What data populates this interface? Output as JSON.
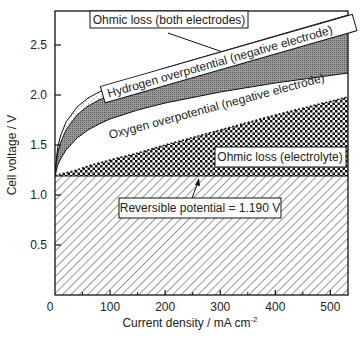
{
  "chart_data": {
    "type": "area",
    "title": "",
    "xlabel": "Current density / mA cm⁻²",
    "xlabel_main": "Current density / mA cm",
    "xlabel_sup": "-2",
    "ylabel": "Cell voltage / V",
    "xlim": [
      0,
      532
    ],
    "ylim": [
      0,
      2.85
    ],
    "xticks": [
      0,
      100,
      200,
      300,
      400,
      500
    ],
    "xtick_labels": [
      "0",
      "100",
      "200",
      "300",
      "400",
      "500"
    ],
    "yticks": [
      0.5,
      1.0,
      1.5,
      2.0,
      2.5
    ],
    "ytick_labels": [
      "0.5",
      "1.0",
      "1.5",
      "2.0",
      "2.5"
    ],
    "grid": false,
    "legend": "none (inline boxed annotations)",
    "x": [
      0,
      5,
      10,
      20,
      40,
      60,
      80,
      100,
      150,
      200,
      300,
      400,
      532
    ],
    "series": [
      {
        "name": "Reversible potential = 1.190 V",
        "pattern": "diagonal-hatch",
        "values": [
          1.19,
          1.19,
          1.19,
          1.19,
          1.19,
          1.19,
          1.19,
          1.19,
          1.19,
          1.19,
          1.19,
          1.19,
          1.19
        ]
      },
      {
        "name": "Ohmic loss (electrolyte)",
        "pattern": "checkerboard",
        "values": [
          1.19,
          1.2,
          1.21,
          1.22,
          1.25,
          1.29,
          1.32,
          1.35,
          1.42,
          1.5,
          1.65,
          1.8,
          1.98
        ]
      },
      {
        "name": "Oxygen overpotential (negative electrode)",
        "pattern": "white",
        "values": [
          1.19,
          1.3,
          1.36,
          1.45,
          1.57,
          1.65,
          1.71,
          1.76,
          1.85,
          1.92,
          2.03,
          2.12,
          2.22
        ]
      },
      {
        "name": "Hydrogen overpotential (negative electrode)",
        "pattern": "gray-stipple",
        "values": [
          1.22,
          1.42,
          1.52,
          1.65,
          1.8,
          1.89,
          1.95,
          2.0,
          2.09,
          2.17,
          2.32,
          2.47,
          2.66
        ]
      },
      {
        "name": "Ohmic loss (both electrodes)",
        "pattern": "light-dots",
        "values": [
          1.25,
          1.48,
          1.59,
          1.73,
          1.88,
          1.97,
          2.03,
          2.08,
          2.18,
          2.27,
          2.43,
          2.59,
          2.8
        ]
      }
    ],
    "annotations": [
      "Ohmic loss (both electrodes)",
      "Hydrogen overpotential (negative electrode)",
      "Oxygen overpotential (negative electrode)",
      "Ohmic loss (electrolyte)",
      "Reversible potential = 1.190 V"
    ]
  },
  "labels": {
    "ohmic_electrodes": "Ohmic loss (both electrodes)",
    "hydrogen": "Hydrogen overpotential (negative electrode)",
    "oxygen": "Oxygen overpotential (negative electrode)",
    "ohmic_electrolyte": "Ohmic loss (electrolyte)",
    "reversible": "Reversible potential = 1.190 V"
  }
}
